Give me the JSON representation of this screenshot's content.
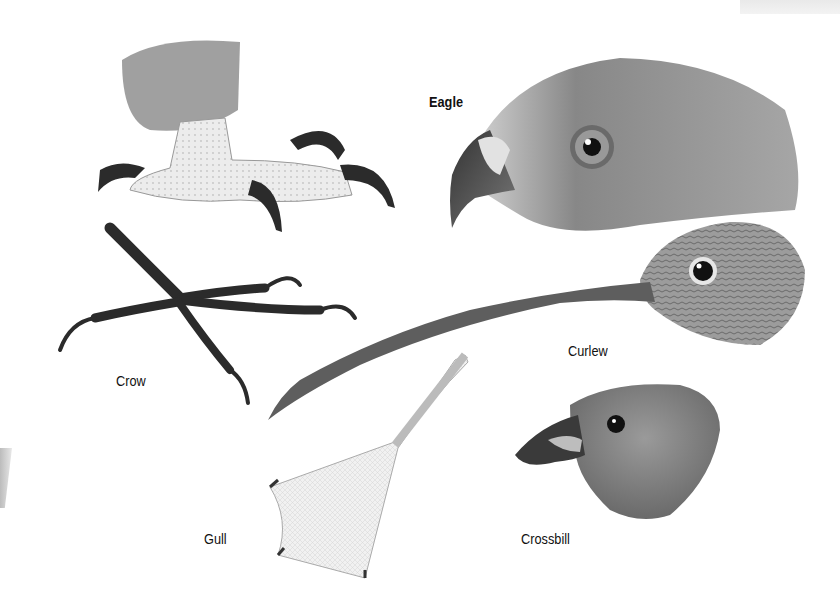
{
  "plate": {
    "subjects": [
      {
        "id": "eagle-foot",
        "kind": "foot",
        "species": "Eagle"
      },
      {
        "id": "eagle-head",
        "kind": "head",
        "species": "Eagle"
      },
      {
        "id": "crow-foot",
        "kind": "foot",
        "species": "Crow"
      },
      {
        "id": "curlew-head",
        "kind": "head",
        "species": "Curlew"
      },
      {
        "id": "gull-foot",
        "kind": "foot",
        "species": "Gull"
      },
      {
        "id": "crossbill-head",
        "kind": "head",
        "species": "Crossbill"
      }
    ],
    "labels": {
      "eagle": "Eagle",
      "crow": "Crow",
      "curlew": "Curlew",
      "gull": "Gull",
      "crossbill": "Crossbill"
    }
  },
  "colors": {
    "background": "#ffffff",
    "ink": "#111111",
    "feather_dark": "#5a5a5a",
    "feather_mid": "#8a8a8a",
    "scale_light": "#e6e6e6",
    "claw": "#222222"
  }
}
